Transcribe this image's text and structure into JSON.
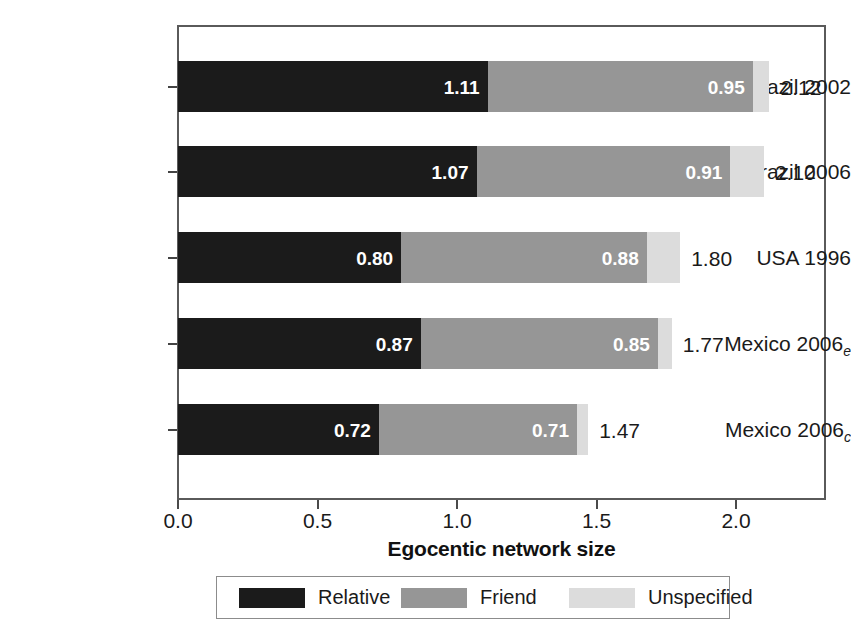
{
  "chart_data": {
    "type": "bar",
    "orientation": "horizontal",
    "stacked": true,
    "title": "",
    "xlabel": "Egocentic network size",
    "ylabel": "",
    "xlim": [
      0.0,
      2.33
    ],
    "xticks": [
      0.0,
      0.5,
      1.0,
      1.5,
      2.0
    ],
    "xticklabels": [
      "0.0",
      "0.5",
      "1.0",
      "1.5",
      "2.0"
    ],
    "grid": false,
    "legend_position": "bottom",
    "categories": [
      "Brazil 2002",
      "Brazil 2006",
      "USA 1996",
      "Mexico 2006e",
      "Mexico 2006c"
    ],
    "category_labels": [
      {
        "main": "Brazil 2002",
        "sub": ""
      },
      {
        "main": "Brazil 2006",
        "sub": ""
      },
      {
        "main": "USA 1996",
        "sub": ""
      },
      {
        "main": "Mexico 2006",
        "sub": "e"
      },
      {
        "main": "Mexico 2006",
        "sub": "c"
      }
    ],
    "series": [
      {
        "name": "Relative",
        "color": "#1b1b1b",
        "values": [
          1.11,
          1.07,
          0.8,
          0.87,
          0.72
        ]
      },
      {
        "name": "Friend",
        "color": "#969696",
        "values": [
          0.95,
          0.91,
          0.88,
          0.85,
          0.71
        ]
      },
      {
        "name": "Unspecified",
        "color": "#dcdcdc",
        "values": [
          0.06,
          0.12,
          0.12,
          0.05,
          0.04
        ]
      }
    ],
    "bar_labels": {
      "relative": [
        "1.11",
        "1.07",
        "0.80",
        "0.87",
        "0.72"
      ],
      "friend": [
        "0.95",
        "0.91",
        "0.88",
        "0.85",
        "0.71"
      ]
    },
    "totals": [
      2.12,
      2.1,
      1.8,
      1.77,
      1.47
    ],
    "total_labels": [
      "2.12",
      "2.10",
      "1.80",
      "1.77",
      "1.47"
    ]
  },
  "legend": {
    "items": [
      {
        "label": "Relative",
        "color": "#1b1b1b"
      },
      {
        "label": "Friend",
        "color": "#969696"
      },
      {
        "label": "Unspecified",
        "color": "#dcdcdc"
      }
    ]
  },
  "axis": {
    "x_title": "Egocentic network size",
    "tick_labels": [
      "0.0",
      "0.5",
      "1.0",
      "1.5",
      "2.0"
    ]
  }
}
